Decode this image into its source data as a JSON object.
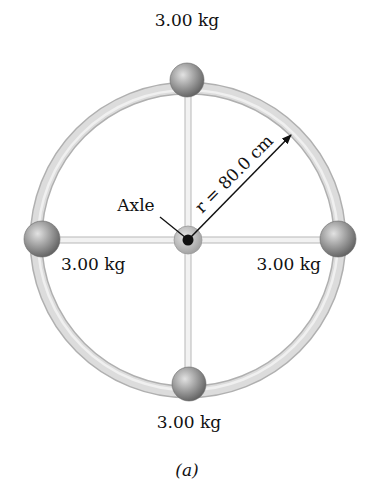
{
  "figure": {
    "caption": "(a)",
    "axle_label": "Axle",
    "radius_label": "r = 80.0 cm",
    "masses": [
      {
        "position": "top",
        "label": "3.00 kg"
      },
      {
        "position": "left",
        "label": "3.00 kg"
      },
      {
        "position": "right",
        "label": "3.00 kg"
      },
      {
        "position": "bottom",
        "label": "3.00 kg"
      }
    ]
  },
  "colors": {
    "ring": "#d2d2d2",
    "ring_edge": "#b4b4b4",
    "spoke": "#c8c8c8",
    "ball_dark": "#6e6e6e",
    "ball_light": "#d8d8d8",
    "axle_hub": "#bdbdbd",
    "axle_center": "#111111",
    "text": "#111111"
  }
}
